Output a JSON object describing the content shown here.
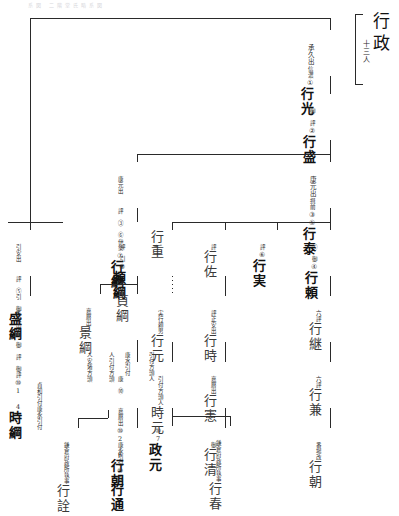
{
  "document": {
    "kind": "japanese-genealogy-chart",
    "faint_header": "系図  二階堂氏略系図",
    "title": {
      "main": "行政",
      "annotation": "十三人"
    }
  },
  "nodes": {
    "n1": {
      "name": "行光",
      "order": "①",
      "note_right": "信濃",
      "note_left": "承久出"
    },
    "n2": {
      "name": "行盛",
      "order": "②",
      "note_left": "御 評"
    },
    "n3": {
      "name": "行泰",
      "order": "③⑤",
      "note_right": "摂前",
      "note_left": "康元出"
    },
    "n4": {
      "name": "行頼",
      "order": "④",
      "note_left": "⑤ 御"
    },
    "n5": {
      "name": "行実",
      "order": "⑥",
      "note_left": "評"
    },
    "n6": {
      "name": "行佐",
      "order": "",
      "note_left": "評"
    },
    "n7": {
      "name": "行重",
      "order": "",
      "note_left": ""
    },
    "n8": {
      "name": "行綱",
      "order": "⑦",
      "note_right": "伊勢",
      "note_left": "康元出",
      "note_left2": "評 ③ ⑥"
    },
    "n9": {
      "name": "頼綱",
      "order": "⑧",
      "note_left": "評 引"
    },
    "n10": {
      "name": "盛綱",
      "order": "",
      "note_left": "引安出",
      "note_left2": "評 ⑤引 御"
    },
    "n11": {
      "name": "時綱",
      "order": "⑩1 4",
      "note_left": "応長出",
      "note_left2": "御 評 御評",
      "note_left3": "康永引付"
    },
    "n12": {
      "name": "景綱",
      "order": "",
      "note_left": "嘉暦出"
    },
    "n13": {
      "name": "貞綱",
      "order": "",
      "note_left": ""
    },
    "n14": {
      "name": "行朝",
      "order": "⑩2 6",
      "note_left": "嘉暦出",
      "note_left2": "康 ⑩",
      "note_left3": "康永引付",
      "note_left4": "貞和引付"
    },
    "n15": {
      "name": "行通",
      "order": "⑩5",
      "note_left": "康永引付"
    },
    "n16": {
      "name": "行詮",
      "order": "",
      "note_left": "鎌倉府政所執事"
    },
    "n17": {
      "name": "行元",
      "order": "",
      "note_left": "実行頼男"
    },
    "n18": {
      "name": "時元",
      "order": "",
      "note_left": "引付方頭人"
    },
    "n19": {
      "name": "政元",
      "order": "⑩7",
      "note_left": ""
    },
    "n20": {
      "name": "行春",
      "order": "",
      "note_left": "鎌倉府政所執事"
    },
    "n21": {
      "name": "行時",
      "order": "",
      "note_left": "評正安出"
    },
    "n22": {
      "name": "行憲",
      "order": "",
      "note_left": "嘉暦出"
    },
    "n23": {
      "name": "行清",
      "order": "",
      "note_left": "御"
    },
    "n24": {
      "name": "行継",
      "order": "",
      "note_left": "六評"
    },
    "n25": {
      "name": "行兼",
      "order": "",
      "note_left": "六評"
    },
    "n26": {
      "name": "行朝",
      "order": "",
      "note_left": "番場改"
    },
    "n27": {
      "name": "人引付方頭",
      "order": "",
      "note_left": ""
    },
    "n28": {
      "name": "人安堵方頭",
      "order": "",
      "note_left": ""
    },
    "n29": {
      "name": "康水引付",
      "order": "",
      "note_left": ""
    }
  },
  "colors": {
    "ink": "#1a1a1a",
    "line": "#2a2a2a",
    "annotation": "#2b2b2b",
    "background": "#ffffff"
  }
}
